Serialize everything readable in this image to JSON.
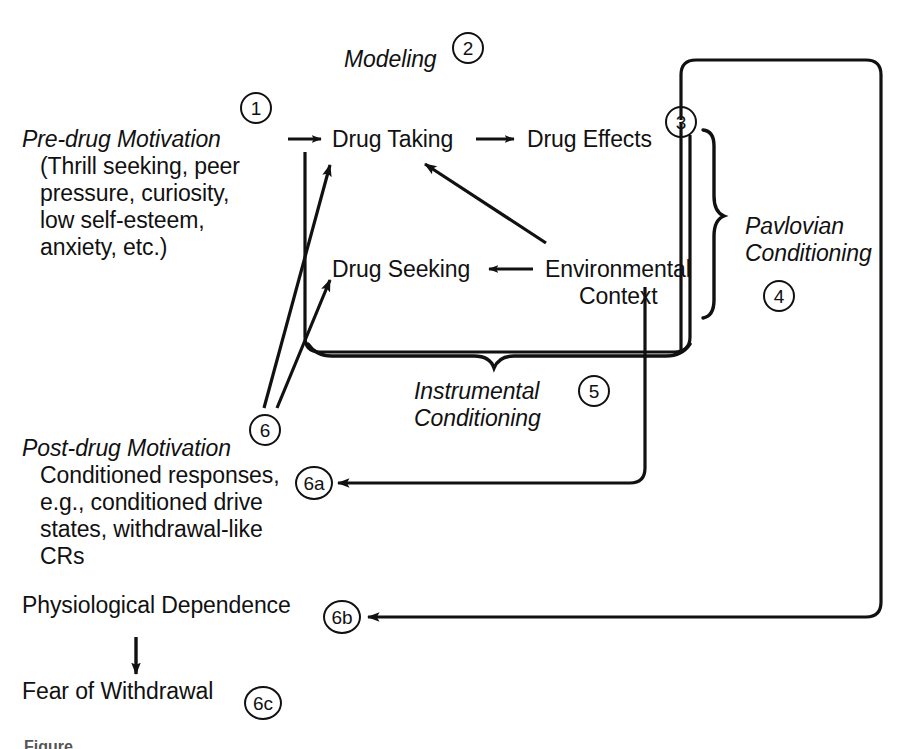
{
  "figure": {
    "type": "conceptual-flow-diagram",
    "background_color": "#ffffff",
    "ink_color": "#111111",
    "caption_partial": "Figure"
  },
  "nodes": {
    "modeling": {
      "label": "Modeling",
      "style": "italic"
    },
    "pre_drug_motivation": {
      "title": "Pre-drug Motivation",
      "lines": [
        "(Thrill seeking, peer",
        "pressure, curiosity,",
        "low self-esteem,",
        "anxiety, etc.)"
      ]
    },
    "drug_taking": {
      "label": "Drug Taking"
    },
    "drug_effects": {
      "label": "Drug Effects"
    },
    "drug_seeking": {
      "label": "Drug Seeking"
    },
    "environmental_context": {
      "line1": "Environmental",
      "line2": "Context"
    },
    "pavlovian_conditioning": {
      "line1": "Pavlovian",
      "line2": "Conditioning",
      "style": "italic"
    },
    "instrumental_conditioning": {
      "line1": "Instrumental",
      "line2": "Conditioning",
      "style": "italic"
    },
    "post_drug_motivation": {
      "title": "Post-drug Motivation",
      "lines": [
        "Conditioned responses,",
        "e.g., conditioned drive",
        "states, withdrawal-like",
        "CRs"
      ]
    },
    "physiological_dependence": {
      "label": "Physiological Dependence"
    },
    "fear_of_withdrawal": {
      "label": "Fear of Withdrawal"
    }
  },
  "markers": [
    {
      "id": "m1",
      "label": "1"
    },
    {
      "id": "m2",
      "label": "2"
    },
    {
      "id": "m3",
      "label": "3"
    },
    {
      "id": "m4",
      "label": "4"
    },
    {
      "id": "m5",
      "label": "5"
    },
    {
      "id": "m6",
      "label": "6"
    },
    {
      "id": "m6a",
      "label": "6a"
    },
    {
      "id": "m6b",
      "label": "6b"
    },
    {
      "id": "m6c",
      "label": "6c"
    }
  ],
  "edges": [
    {
      "from": "pre_drug_motivation",
      "to": "drug_taking",
      "kind": "arrow-right"
    },
    {
      "from": "drug_taking",
      "to": "drug_effects",
      "kind": "arrow-right"
    },
    {
      "from": "environmental_context",
      "to": "drug_seeking",
      "kind": "arrow-left"
    },
    {
      "from": "environmental_context",
      "to": "drug_taking",
      "kind": "arrow-diagonal-up-left"
    },
    {
      "from": "post_drug_motivation",
      "to": "drug_taking",
      "kind": "arrow-diagonal-up-right"
    },
    {
      "from": "post_drug_motivation",
      "to": "drug_seeking",
      "kind": "arrow-diagonal-up-right"
    },
    {
      "from": "drug_effects",
      "to": "post_drug_motivation",
      "kind": "routed-arrow-left",
      "marker": "6a"
    },
    {
      "from": "drug_effects",
      "to": "physiological_dependence",
      "kind": "routed-arrow-left",
      "marker": "6b"
    },
    {
      "from": "physiological_dependence",
      "to": "fear_of_withdrawal",
      "kind": "arrow-down"
    }
  ]
}
